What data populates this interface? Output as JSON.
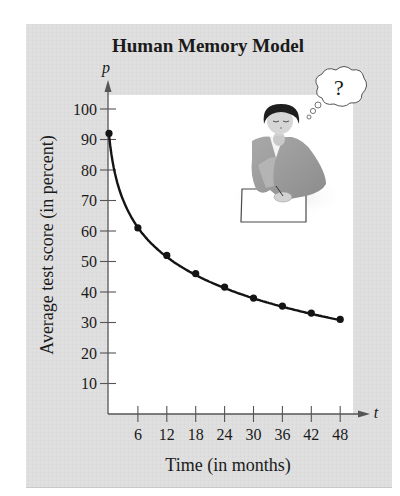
{
  "chart_data": {
    "type": "line",
    "title": "Human Memory Model",
    "xlabel": "Time (in months)",
    "ylabel": "Average test score (in percent)",
    "x_axis_variable": "t",
    "y_axis_variable": "p",
    "x_ticks": [
      6,
      12,
      18,
      24,
      30,
      36,
      42,
      48
    ],
    "y_ticks": [
      10,
      20,
      30,
      40,
      50,
      60,
      70,
      80,
      90,
      100
    ],
    "xlim": [
      0,
      50
    ],
    "ylim": [
      0,
      105
    ],
    "grid": false,
    "legend": null,
    "series": [
      {
        "name": "Average test score",
        "x": [
          0,
          6,
          12,
          18,
          24,
          30,
          36,
          42,
          48
        ],
        "values": [
          92,
          61,
          52,
          46,
          41.6,
          38,
          35.4,
          33.1,
          31
        ],
        "markers": true
      }
    ],
    "annotations": [
      "Illustration of a thinking woman with a thought bubble containing \"?\""
    ],
    "thought_bubble_text": "?"
  },
  "colors": {
    "panel_background": "#dedede",
    "plot_background": "#ffffff",
    "line": "#141414",
    "axis": "#555555"
  }
}
